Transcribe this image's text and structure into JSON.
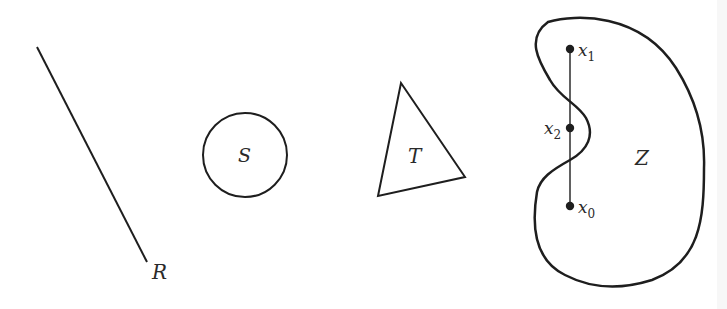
{
  "figure": {
    "colors": {
      "stroke": "#1e1e1e",
      "label": "#2a2a2a",
      "background": "#ffffff"
    },
    "shapes": {
      "line_segment": {
        "label": "R"
      },
      "circle": {
        "label": "S"
      },
      "triangle": {
        "label": "T"
      },
      "region": {
        "label": "Z"
      }
    },
    "points": [
      {
        "name": "x",
        "sub": "1"
      },
      {
        "name": "x",
        "sub": "2"
      },
      {
        "name": "x",
        "sub": "0"
      }
    ]
  }
}
